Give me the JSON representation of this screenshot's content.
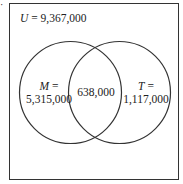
{
  "marker": "·",
  "universe": {
    "symbol": "U",
    "equals": " = ",
    "value": "9,367,000"
  },
  "sets": [
    {
      "symbol": "M",
      "equals": " =",
      "value": "5,315,000"
    },
    {
      "symbol": "T",
      "equals": " =",
      "value": "1,117,000"
    }
  ],
  "intersection": {
    "value": "638,000"
  },
  "colors": {
    "stroke": "#333333",
    "background": "#ffffff"
  }
}
